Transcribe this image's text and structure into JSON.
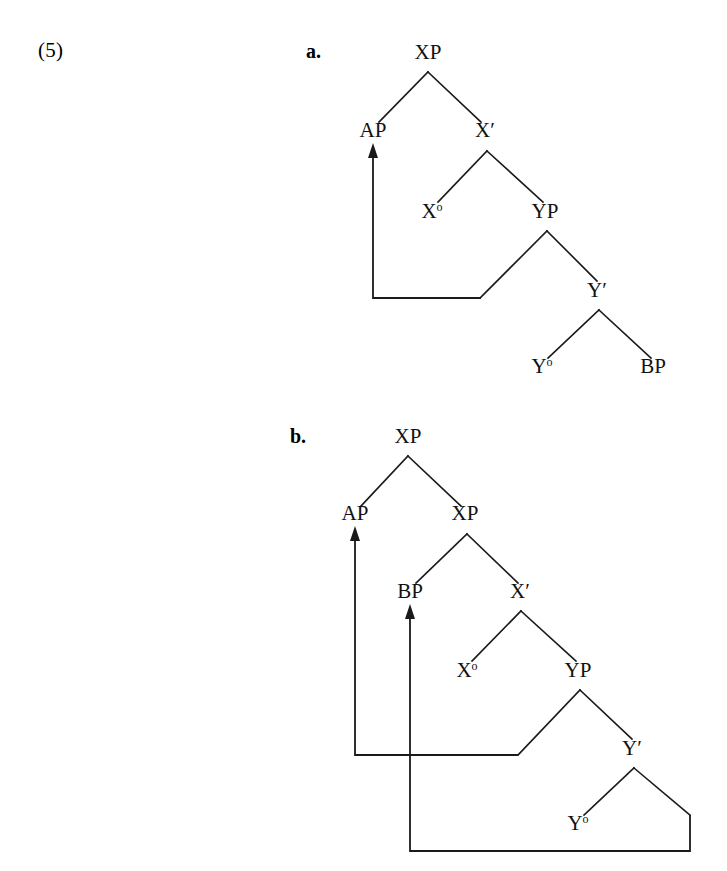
{
  "page": {
    "example_number": "(5)",
    "background_color": "#ffffff",
    "ink_color": "#1a1a1a"
  },
  "trees": [
    {
      "id": "tree-a",
      "label": "a.",
      "nodes": [
        {
          "name": "root-xp",
          "text": "XP",
          "sup": "",
          "x": 428,
          "y": 59
        },
        {
          "name": "ap",
          "text": "AP",
          "sup": "",
          "x": 373,
          "y": 137
        },
        {
          "name": "x-bar",
          "text": "X",
          "sup": "′",
          "x": 485,
          "y": 137
        },
        {
          "name": "x-zero",
          "text": "X",
          "sup": "o",
          "x": 432,
          "y": 218
        },
        {
          "name": "yp",
          "text": "YP",
          "sup": "",
          "x": 545,
          "y": 218
        },
        {
          "name": "y-bar",
          "text": "Y",
          "sup": "′",
          "x": 597,
          "y": 297
        },
        {
          "name": "y-zero",
          "text": "Y",
          "sup": "o",
          "x": 542,
          "y": 373
        },
        {
          "name": "bp",
          "text": "BP",
          "sup": "",
          "x": 653,
          "y": 373
        }
      ],
      "movement": [
        {
          "name": "movement-arrow-ap-from-yp-spec",
          "from": "YP specifier",
          "to": "AP"
        }
      ]
    },
    {
      "id": "tree-b",
      "label": "b.",
      "nodes": [
        {
          "name": "root-xp",
          "text": "XP",
          "sup": "",
          "x": 408,
          "y": 443
        },
        {
          "name": "ap",
          "text": "AP",
          "sup": "",
          "x": 355,
          "y": 520
        },
        {
          "name": "inner-xp",
          "text": "XP",
          "sup": "",
          "x": 465,
          "y": 520
        },
        {
          "name": "bp",
          "text": "BP",
          "sup": "",
          "x": 410,
          "y": 598
        },
        {
          "name": "x-bar",
          "text": "X",
          "sup": "′",
          "x": 520,
          "y": 598
        },
        {
          "name": "x-zero",
          "text": "X",
          "sup": "o",
          "x": 467,
          "y": 677
        },
        {
          "name": "yp",
          "text": "YP",
          "sup": "",
          "x": 578,
          "y": 677
        },
        {
          "name": "y-bar",
          "text": "Y",
          "sup": "′",
          "x": 632,
          "y": 755
        },
        {
          "name": "y-zero",
          "text": "Y",
          "sup": "o",
          "x": 578,
          "y": 830
        }
      ],
      "movement": [
        {
          "name": "movement-arrow-ap-from-yp-spec",
          "from": "YP specifier",
          "to": "AP"
        },
        {
          "name": "movement-arrow-bp-from-y-bar-complement",
          "from": "Y-bar complement",
          "to": "BP"
        }
      ]
    }
  ]
}
